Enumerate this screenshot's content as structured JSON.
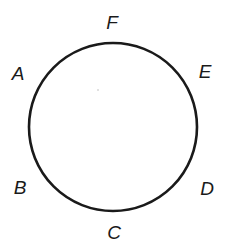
{
  "diagram": {
    "circle": {
      "cx": 113,
      "cy": 127,
      "r": 84,
      "stroke": "#1a1a1a",
      "stroke_width": 2.6
    },
    "points": [
      {
        "label": "F",
        "x": 112,
        "y": 29
      },
      {
        "label": "A",
        "x": 18,
        "y": 80
      },
      {
        "label": "E",
        "x": 205,
        "y": 78
      },
      {
        "label": "B",
        "x": 20,
        "y": 194
      },
      {
        "label": "D",
        "x": 207,
        "y": 195
      },
      {
        "label": "C",
        "x": 114,
        "y": 239
      }
    ]
  }
}
